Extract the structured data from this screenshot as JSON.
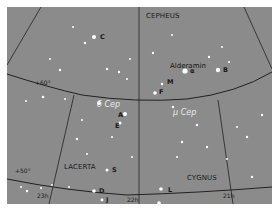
{
  "map": {
    "background": "#8b8b8b",
    "constellations": [
      {
        "name": "CEPHEUS",
        "x": 146,
        "y": 13
      },
      {
        "name": "LACERTA",
        "x": 57,
        "y": 158
      },
      {
        "name": "CYGNUS",
        "x": 180,
        "y": 170
      }
    ],
    "named_stars": [
      {
        "name": "Alderamin",
        "x": 170,
        "y": 56
      }
    ],
    "variable_stars": [
      {
        "name": "δ Cep",
        "x": 88,
        "y": 93
      },
      {
        "name": "μ Cep",
        "x": 157,
        "y": 102
      }
    ],
    "star_labels": [
      {
        "label": "C",
        "x": 92,
        "y": 30
      },
      {
        "label": "α",
        "x": 189,
        "y": 66
      },
      {
        "label": "B",
        "x": 219,
        "y": 64
      },
      {
        "label": "M",
        "x": 165,
        "y": 75
      },
      {
        "label": "F",
        "x": 156,
        "y": 83
      },
      {
        "label": "A",
        "x": 111,
        "y": 106
      },
      {
        "label": "E",
        "x": 108,
        "y": 118
      },
      {
        "label": "S",
        "x": 104,
        "y": 161
      },
      {
        "label": "D",
        "x": 90,
        "y": 176
      },
      {
        "label": "J",
        "x": 98,
        "y": 188
      },
      {
        "label": "L",
        "x": 168,
        "y": 176
      }
    ],
    "grid_labels": [
      {
        "label": "+60°",
        "x": 28,
        "y": 74
      },
      {
        "label": "+50°",
        "x": 8,
        "y": 164
      },
      {
        "label": "23h",
        "x": 32,
        "y": 189
      },
      {
        "label": "22h",
        "x": 124,
        "y": 196
      },
      {
        "label": "21h",
        "x": 218,
        "y": 189
      }
    ],
    "colors": {
      "star": "#ffffff",
      "boundary": "#1e1e1e",
      "label": "#1a1a1a",
      "variable_label": "#e9e9e9"
    }
  }
}
